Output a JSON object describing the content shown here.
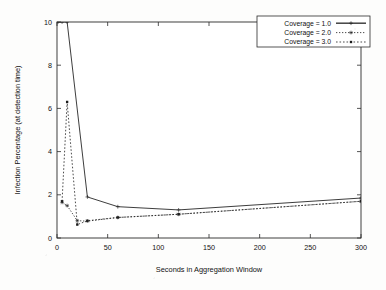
{
  "chart_data": {
    "type": "line",
    "title": "",
    "xlabel": "Seconds in Aggregation Window",
    "ylabel": "Infection Percentage (at detection time)",
    "xlim": [
      0,
      300
    ],
    "ylim": [
      0,
      10
    ],
    "xticks": [
      0,
      50,
      100,
      150,
      200,
      250,
      300
    ],
    "yticks": [
      0,
      2,
      4,
      6,
      8,
      10
    ],
    "xtick_labels": [
      "0",
      "50",
      "100",
      "150",
      "200",
      "250",
      "300"
    ],
    "ytick_labels": [
      "0",
      "2",
      "4",
      "6",
      "8",
      "10"
    ],
    "grid": false,
    "legend_position": "upper right",
    "series": [
      {
        "name": "Coverage = 1.0",
        "style": "solid",
        "marker": "plus",
        "x": [
          1,
          5,
          10,
          30,
          60,
          120,
          300
        ],
        "y": [
          10.0,
          10.0,
          10.0,
          1.9,
          1.45,
          1.3,
          1.85
        ]
      },
      {
        "name": "Coverage = 2.0",
        "style": "dotted",
        "marker": "star",
        "x": [
          5,
          10,
          20,
          30,
          60,
          120,
          300
        ],
        "y": [
          1.65,
          1.5,
          0.8,
          0.78,
          0.95,
          1.1,
          1.7
        ]
      },
      {
        "name": "Coverage = 3.0",
        "style": "dotted",
        "marker": "square",
        "x": [
          5,
          10,
          20,
          30,
          60,
          120,
          300
        ],
        "y": [
          1.7,
          6.3,
          0.62,
          0.8,
          0.95,
          1.1,
          1.7
        ]
      }
    ]
  },
  "legend": {
    "entries": [
      {
        "label": "Coverage = 1.0"
      },
      {
        "label": "Coverage = 2.0"
      },
      {
        "label": "Coverage = 3.0"
      }
    ]
  }
}
